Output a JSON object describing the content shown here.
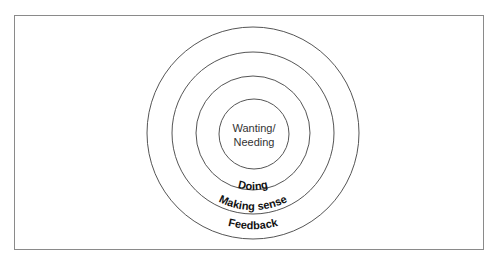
{
  "diagram": {
    "type": "concentric-circles",
    "center": {
      "x": 253,
      "y": 133
    },
    "layers": [
      {
        "id": "core",
        "label_lines": [
          "Wanting/",
          "Needing"
        ],
        "radius": 35
      },
      {
        "id": "doing",
        "label": "Doing",
        "radius": 57
      },
      {
        "id": "making-sense",
        "label": "Making sense",
        "radius": 81
      },
      {
        "id": "feedback",
        "label": "Feedback",
        "radius": 106
      }
    ],
    "colors": {
      "stroke": "#555555",
      "frame": "#8a8a8a",
      "text": "#111111",
      "background": "#ffffff"
    }
  }
}
